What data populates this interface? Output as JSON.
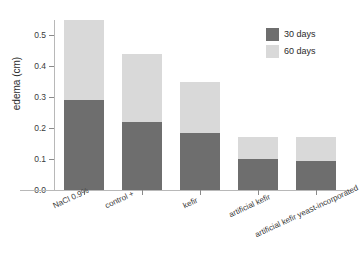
{
  "chart_data": {
    "type": "bar",
    "subtype": "stacked",
    "title": "",
    "xlabel": "",
    "ylabel": "edema (cm)",
    "ylim": [
      0.0,
      0.55
    ],
    "yticks": [
      "0.0",
      "0.1",
      "0.2",
      "0.3",
      "0.4",
      "0.5"
    ],
    "ytick_values": [
      0.0,
      0.1,
      0.2,
      0.3,
      0.4,
      0.5
    ],
    "grid": false,
    "legend_position": "top-right",
    "categories": [
      "NaCl 0.9%",
      "control +",
      "kefir",
      "artificial kefir",
      "artificial kefir yeast-incorporated"
    ],
    "series": [
      {
        "name": "30 days",
        "color": "#6e6e6e",
        "values": [
          0.29,
          0.22,
          0.185,
          0.1,
          0.095
        ]
      },
      {
        "name": "60 days",
        "color": "#d9d9d9",
        "values": [
          0.26,
          0.22,
          0.165,
          0.07,
          0.075
        ]
      }
    ],
    "totals": [
      0.55,
      0.44,
      0.35,
      0.17,
      0.17
    ]
  },
  "legend": {
    "items": [
      {
        "label": "30 days",
        "color": "#6e6e6e"
      },
      {
        "label": "60 days",
        "color": "#d9d9d9"
      }
    ]
  },
  "colors": {
    "series_30_days": "#6e6e6e",
    "series_60_days": "#d9d9d9",
    "axis": "#b8b8b8",
    "text": "#2b2b2b",
    "background": "#ffffff"
  }
}
